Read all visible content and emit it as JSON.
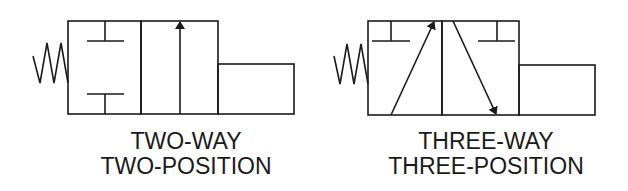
{
  "figure": {
    "stroke_color": "#1a1a1a",
    "background": "#ffffff"
  },
  "symbols": [
    {
      "id": "two-way-two-position",
      "caption": {
        "line1": "TWO-WAY",
        "line2": "TWO-POSITION"
      },
      "actuators": [
        "spring-return",
        "solenoid"
      ],
      "envelopes": [
        {
          "position": 1,
          "content": "blocked ports (two T-stops)"
        },
        {
          "position": 2,
          "content": "flow arrow upward"
        }
      ]
    },
    {
      "id": "three-way-three-position",
      "caption": {
        "line1": "THREE-WAY",
        "line2": "THREE-POSITION"
      },
      "actuators": [
        "spring-return",
        "solenoid"
      ],
      "envelopes": [
        {
          "position": 1,
          "content": "T-stop and diagonal arrow up-right"
        },
        {
          "position": 2,
          "content": "diagonal arrow down-right and T-stop"
        }
      ]
    }
  ]
}
